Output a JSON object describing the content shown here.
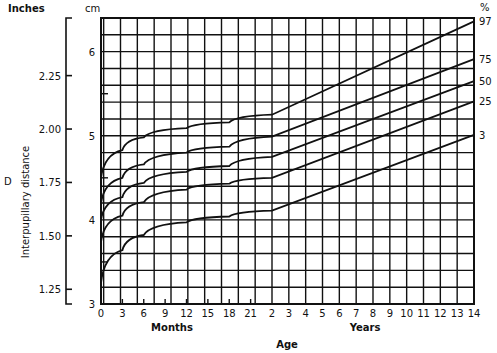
{
  "chart_data": {
    "type": "line",
    "title": "",
    "xlabel": "Age",
    "x_sublabels": {
      "months": "Months",
      "years": "Years"
    },
    "ylabel": "Interpupillary distance",
    "side_letter": "D",
    "y_units": {
      "inches": "Inches",
      "cm": "cm",
      "percent": "%"
    },
    "cm_ticks": [
      "3",
      "4",
      "5",
      "6"
    ],
    "inch_ticks": [
      "1.25",
      "1.50",
      "1.75",
      "2.00",
      "2.25"
    ],
    "month_ticks": [
      "0",
      "3",
      "6",
      "9",
      "12",
      "15",
      "18",
      "21"
    ],
    "year_ticks": [
      "2",
      "3",
      "4",
      "5",
      "6",
      "7",
      "8",
      "9",
      "10",
      "11",
      "12",
      "13",
      "14"
    ],
    "ylim_cm": [
      3.0,
      6.4
    ],
    "grid": true,
    "legend_position": "right-end-of-curves",
    "x_age_points": [
      "0 mo",
      "3 mo",
      "6 mo",
      "12 mo",
      "18 mo",
      "2 yr",
      "14 yr"
    ],
    "series": [
      {
        "name": "97",
        "values_cm": [
          4.5,
          4.83,
          4.98,
          5.09,
          5.16,
          5.25,
          6.36
        ]
      },
      {
        "name": "75",
        "values_cm": [
          4.2,
          4.5,
          4.66,
          4.8,
          4.87,
          4.99,
          5.91
        ]
      },
      {
        "name": "50",
        "values_cm": [
          4.0,
          4.27,
          4.44,
          4.57,
          4.64,
          4.75,
          5.65
        ]
      },
      {
        "name": "25",
        "values_cm": [
          3.74,
          4.05,
          4.21,
          4.36,
          4.43,
          4.5,
          5.41
        ]
      },
      {
        "name": "3",
        "values_cm": [
          3.25,
          3.64,
          3.82,
          3.97,
          4.04,
          4.11,
          5.01
        ]
      }
    ]
  }
}
